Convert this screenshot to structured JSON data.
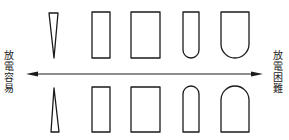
{
  "diagram": {
    "type": "electrode-tip-shape-discharge-comparison",
    "label_left": [
      "放",
      "電",
      "容",
      "易"
    ],
    "label_right": [
      "放",
      "電",
      "困",
      "難"
    ],
    "label_left_text": "放電容易",
    "label_right_text": "放電困難",
    "arrow": {
      "direction": "bidirectional",
      "meaning": "discharge ease scale"
    },
    "shapes_top_row": [
      {
        "name": "sharp-cone-pointing-down"
      },
      {
        "name": "narrow-rectangle"
      },
      {
        "name": "wide-rectangle"
      },
      {
        "name": "narrow-rounded-bottom"
      },
      {
        "name": "wide-rounded-bottom"
      }
    ],
    "shapes_bottom_row": [
      {
        "name": "sharp-cone-pointing-up"
      },
      {
        "name": "narrow-rectangle"
      },
      {
        "name": "wide-rectangle"
      },
      {
        "name": "narrow-rounded-top"
      },
      {
        "name": "wide-rounded-top"
      }
    ],
    "colors": {
      "stroke": "#1a1a1a",
      "background": "#ffffff"
    }
  }
}
